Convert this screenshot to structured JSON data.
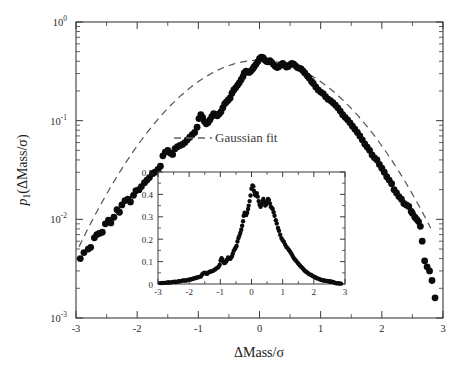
{
  "chart_data": {
    "type": "scatter",
    "title": "",
    "xlabel": "ΔMass/σ",
    "ylabel": "p₁(ΔMass/σ)",
    "yscale": "log",
    "xlim": [
      -3,
      3
    ],
    "ylim": [
      0.001,
      1
    ],
    "grid": false,
    "xticks": [
      -3,
      -2,
      -1,
      0,
      1,
      2,
      3
    ],
    "xticklabels": [
      "-3",
      "-2",
      "-1",
      "0",
      "1",
      "2",
      "3"
    ],
    "yticks": [
      0.001,
      0.01,
      0.1,
      1
    ],
    "yticklabels": [
      "10",
      "10",
      "10",
      "10"
    ],
    "yticklabel_exponents": [
      "-3",
      "-2",
      "-1",
      "0"
    ],
    "legend": {
      "position": "center-left",
      "entries": [
        {
          "label": "Gaussian fit",
          "style": "dashed",
          "color": "#666666"
        }
      ]
    },
    "series": [
      {
        "name": "p1 data",
        "marker": "filled-circle",
        "color": "#0b0b0b",
        "points": [
          [
            -2.93,
            0.004
          ],
          [
            -2.87,
            0.0046
          ],
          [
            -2.8,
            0.005
          ],
          [
            -2.76,
            0.0052
          ],
          [
            -2.7,
            0.0065
          ],
          [
            -2.66,
            0.007
          ],
          [
            -2.62,
            0.0072
          ],
          [
            -2.57,
            0.0074
          ],
          [
            -2.52,
            0.009
          ],
          [
            -2.47,
            0.0098
          ],
          [
            -2.43,
            0.0092
          ],
          [
            -2.38,
            0.0105
          ],
          [
            -2.33,
            0.0125
          ],
          [
            -2.29,
            0.0118
          ],
          [
            -2.25,
            0.014
          ],
          [
            -2.2,
            0.0155
          ],
          [
            -2.15,
            0.016
          ],
          [
            -2.11,
            0.015
          ],
          [
            -2.06,
            0.0175
          ],
          [
            -2.02,
            0.0195
          ],
          [
            -1.97,
            0.02
          ],
          [
            -1.93,
            0.0215
          ],
          [
            -1.88,
            0.0235
          ],
          [
            -1.84,
            0.025
          ],
          [
            -1.8,
            0.0265
          ],
          [
            -1.75,
            0.029
          ],
          [
            -1.71,
            0.03
          ],
          [
            -1.66,
            0.032
          ],
          [
            -1.62,
            0.0345
          ],
          [
            -1.58,
            0.044
          ],
          [
            -1.54,
            0.048
          ],
          [
            -1.5,
            0.05
          ],
          [
            -1.46,
            0.047
          ],
          [
            -1.42,
            0.0455
          ],
          [
            -1.38,
            0.052
          ],
          [
            -1.34,
            0.0545
          ],
          [
            -1.3,
            0.056
          ],
          [
            -1.26,
            0.0575
          ],
          [
            -1.22,
            0.06
          ],
          [
            -1.18,
            0.064
          ],
          [
            -1.14,
            0.068
          ],
          [
            -1.1,
            0.072
          ],
          [
            -1.06,
            0.076
          ],
          [
            -1.02,
            0.086
          ],
          [
            -0.99,
            0.105
          ],
          [
            -0.96,
            0.115
          ],
          [
            -0.93,
            0.108
          ],
          [
            -0.9,
            0.098
          ],
          [
            -0.87,
            0.093
          ],
          [
            -0.84,
            0.096
          ],
          [
            -0.81,
            0.102
          ],
          [
            -0.78,
            0.11
          ],
          [
            -0.75,
            0.118
          ],
          [
            -0.72,
            0.115
          ],
          [
            -0.69,
            0.112
          ],
          [
            -0.66,
            0.117
          ],
          [
            -0.63,
            0.123
          ],
          [
            -0.6,
            0.135
          ],
          [
            -0.57,
            0.148
          ],
          [
            -0.54,
            0.155
          ],
          [
            -0.51,
            0.162
          ],
          [
            -0.48,
            0.17
          ],
          [
            -0.45,
            0.19
          ],
          [
            -0.42,
            0.205
          ],
          [
            -0.39,
            0.215
          ],
          [
            -0.36,
            0.228
          ],
          [
            -0.33,
            0.242
          ],
          [
            -0.3,
            0.26
          ],
          [
            -0.27,
            0.28
          ],
          [
            -0.25,
            0.305
          ],
          [
            -0.22,
            0.318
          ],
          [
            -0.19,
            0.312
          ],
          [
            -0.17,
            0.308
          ],
          [
            -0.14,
            0.318
          ],
          [
            -0.11,
            0.335
          ],
          [
            -0.09,
            0.35
          ],
          [
            -0.06,
            0.37
          ],
          [
            -0.03,
            0.395
          ],
          [
            0.0,
            0.425
          ],
          [
            0.03,
            0.44
          ],
          [
            0.06,
            0.435
          ],
          [
            0.08,
            0.415
          ],
          [
            0.11,
            0.4
          ],
          [
            0.14,
            0.395
          ],
          [
            0.17,
            0.405
          ],
          [
            0.2,
            0.39
          ],
          [
            0.23,
            0.37
          ],
          [
            0.26,
            0.355
          ],
          [
            0.29,
            0.345
          ],
          [
            0.32,
            0.355
          ],
          [
            0.35,
            0.37
          ],
          [
            0.38,
            0.38
          ],
          [
            0.41,
            0.365
          ],
          [
            0.44,
            0.35
          ],
          [
            0.47,
            0.355
          ],
          [
            0.5,
            0.37
          ],
          [
            0.53,
            0.38
          ],
          [
            0.56,
            0.375
          ],
          [
            0.59,
            0.36
          ],
          [
            0.62,
            0.345
          ],
          [
            0.65,
            0.34
          ],
          [
            0.68,
            0.335
          ],
          [
            0.71,
            0.32
          ],
          [
            0.74,
            0.305
          ],
          [
            0.78,
            0.285
          ],
          [
            0.81,
            0.27
          ],
          [
            0.85,
            0.25
          ],
          [
            0.88,
            0.238
          ],
          [
            0.92,
            0.22
          ],
          [
            0.96,
            0.205
          ],
          [
            1.0,
            0.195
          ],
          [
            1.04,
            0.188
          ],
          [
            1.08,
            0.175
          ],
          [
            1.12,
            0.165
          ],
          [
            1.16,
            0.16
          ],
          [
            1.2,
            0.152
          ],
          [
            1.24,
            0.144
          ],
          [
            1.28,
            0.135
          ],
          [
            1.32,
            0.125
          ],
          [
            1.36,
            0.115
          ],
          [
            1.4,
            0.108
          ],
          [
            1.44,
            0.102
          ],
          [
            1.48,
            0.095
          ],
          [
            1.52,
            0.088
          ],
          [
            1.56,
            0.082
          ],
          [
            1.6,
            0.076
          ],
          [
            1.64,
            0.07
          ],
          [
            1.68,
            0.064
          ],
          [
            1.72,
            0.058
          ],
          [
            1.76,
            0.054
          ],
          [
            1.8,
            0.05
          ],
          [
            1.84,
            0.045
          ],
          [
            1.88,
            0.042
          ],
          [
            1.92,
            0.04
          ],
          [
            1.96,
            0.036
          ],
          [
            2.0,
            0.033
          ],
          [
            2.04,
            0.03
          ],
          [
            2.08,
            0.027
          ],
          [
            2.12,
            0.025
          ],
          [
            2.16,
            0.023
          ],
          [
            2.2,
            0.02
          ],
          [
            2.24,
            0.0185
          ],
          [
            2.28,
            0.017
          ],
          [
            2.32,
            0.016
          ],
          [
            2.36,
            0.0145
          ],
          [
            2.4,
            0.014
          ],
          [
            2.44,
            0.0135
          ],
          [
            2.48,
            0.012
          ],
          [
            2.5,
            0.0115
          ],
          [
            2.54,
            0.0105
          ],
          [
            2.57,
            0.01
          ],
          [
            2.6,
            0.0095
          ],
          [
            2.63,
            0.0085
          ],
          [
            2.66,
            0.006
          ],
          [
            2.7,
            0.0038
          ],
          [
            2.74,
            0.0033
          ],
          [
            2.78,
            0.003
          ],
          [
            2.82,
            0.0024
          ],
          [
            2.87,
            0.0016
          ]
        ]
      }
    ],
    "fit": {
      "name": "Gaussian fit",
      "style": "dashed",
      "amplitude": 0.41,
      "mean": 0.0,
      "sigma": 1.0,
      "xrange": [
        -2.95,
        2.8
      ]
    },
    "inset": {
      "type": "scatter",
      "yscale": "linear",
      "xlim": [
        -3,
        3
      ],
      "ylim": [
        0,
        0.5
      ],
      "xticks": [
        -3,
        -2,
        -1,
        0,
        1,
        2,
        3
      ],
      "xticklabels": [
        "-3",
        "-2",
        "-1",
        "0",
        "1",
        "2",
        "3"
      ],
      "yticks": [
        0,
        0.1,
        0.2,
        0.3,
        0.4,
        0.5
      ],
      "yticklabels": [
        "0",
        "0.1",
        "0.2",
        "0.3",
        "0.4",
        "0.5"
      ],
      "marker": "filled-circle",
      "color": "#0b0b0b"
    }
  },
  "legend_label": "Gaussian fit",
  "axis": {
    "x_label": "ΔMass/σ",
    "y_label_base": "p",
    "y_label_sub": "1",
    "y_label_arg": "(ΔMass/σ)"
  }
}
